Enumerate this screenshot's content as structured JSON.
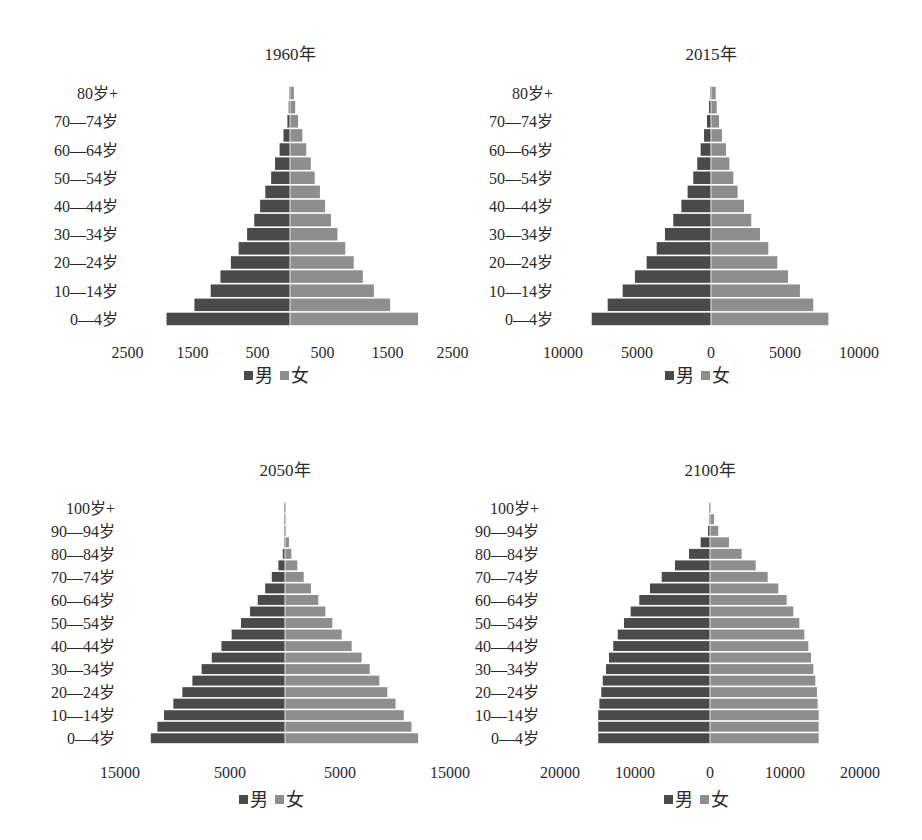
{
  "colors": {
    "male": "#4a4a4a",
    "female": "#8e8e8e",
    "gap": "#ffffff"
  },
  "legend": {
    "male": "男",
    "female": "女"
  },
  "chart_data": [
    {
      "type": "bar",
      "orientation": "horizontal",
      "subtype": "population-pyramid",
      "title": "1960年",
      "categories": [
        "0—4岁",
        "5—9岁",
        "10—14岁",
        "15—19岁",
        "20—24岁",
        "25—29岁",
        "30—34岁",
        "35—39岁",
        "40—44岁",
        "45—49岁",
        "50—54岁",
        "55—59岁",
        "60—64岁",
        "65—69岁",
        "70—74岁",
        "75—79岁",
        "80岁+"
      ],
      "visible_category_labels": [
        "0—4岁",
        "10—14岁",
        "20—24岁",
        "30—34岁",
        "40—44岁",
        "50—54岁",
        "60—64岁",
        "70—74岁",
        "80岁+"
      ],
      "series": [
        {
          "name": "男",
          "side": "left",
          "values": [
            1900,
            1470,
            1220,
            1070,
            910,
            790,
            660,
            550,
            460,
            380,
            290,
            230,
            160,
            100,
            40,
            20,
            5
          ]
        },
        {
          "name": "女",
          "side": "right",
          "values": [
            1970,
            1540,
            1290,
            1120,
            980,
            850,
            730,
            630,
            540,
            460,
            380,
            320,
            250,
            190,
            125,
            80,
            60
          ]
        }
      ],
      "xticks": [
        "2500",
        "1500",
        "500",
        "500",
        "1500",
        "2500"
      ],
      "xtick_values": [
        -2500,
        -1500,
        -500,
        500,
        1500,
        2500
      ],
      "xlim": [
        -2500,
        2500
      ],
      "legend_position": "bottom",
      "grid": false
    },
    {
      "type": "bar",
      "orientation": "horizontal",
      "subtype": "population-pyramid",
      "title": "2015年",
      "categories": [
        "0—4岁",
        "5—9岁",
        "10—14岁",
        "15—19岁",
        "20—24岁",
        "25—29岁",
        "30—34岁",
        "35—39岁",
        "40—44岁",
        "45—49岁",
        "50—54岁",
        "55—59岁",
        "60—64岁",
        "65—69岁",
        "70—74岁",
        "75—79岁",
        "80岁+"
      ],
      "visible_category_labels": [
        "0—4岁",
        "10—14岁",
        "20—24岁",
        "30—34岁",
        "40—44岁",
        "50—54岁",
        "60—64岁",
        "70—74岁",
        "80岁+"
      ],
      "series": [
        {
          "name": "男",
          "side": "left",
          "values": [
            8060,
            6980,
            5970,
            5140,
            4350,
            3670,
            3110,
            2550,
            2000,
            1580,
            1200,
            930,
            700,
            470,
            270,
            135,
            20
          ]
        },
        {
          "name": "女",
          "side": "right",
          "values": [
            7930,
            6910,
            6010,
            5200,
            4480,
            3870,
            3310,
            2720,
            2230,
            1800,
            1510,
            1240,
            1010,
            740,
            540,
            385,
            315
          ]
        }
      ],
      "xticks": [
        "10000",
        "5000",
        "0",
        "5000",
        "10000"
      ],
      "xtick_values": [
        -10000,
        -5000,
        0,
        5000,
        10000
      ],
      "xlim": [
        -10000,
        10000
      ],
      "legend_position": "bottom",
      "grid": false
    },
    {
      "type": "bar",
      "orientation": "horizontal",
      "subtype": "population-pyramid",
      "title": "2050年",
      "categories": [
        "0—4岁",
        "5—9岁",
        "10—14岁",
        "15—19岁",
        "20—24岁",
        "25—29岁",
        "30—34岁",
        "35—39岁",
        "40—44岁",
        "45—49岁",
        "50—54岁",
        "55—59岁",
        "60—64岁",
        "65—69岁",
        "70—74岁",
        "75—79岁",
        "80—84岁",
        "85—89岁",
        "90—94岁",
        "95—99岁",
        "100岁+"
      ],
      "visible_category_labels": [
        "0—4岁",
        "10—14岁",
        "20—24岁",
        "30—34岁",
        "40—44岁",
        "50—54岁",
        "60—64岁",
        "70—74岁",
        "80—84岁",
        "90—94岁",
        "100岁+"
      ],
      "series": [
        {
          "name": "男",
          "side": "left",
          "values": [
            12200,
            11600,
            11000,
            10150,
            9330,
            8420,
            7580,
            6660,
            5780,
            4850,
            4000,
            3180,
            2480,
            1800,
            1200,
            600,
            200,
            40,
            10,
            5,
            2
          ]
        },
        {
          "name": "女",
          "side": "right",
          "values": [
            12100,
            11500,
            10800,
            10050,
            9300,
            8570,
            7700,
            6970,
            6060,
            5150,
            4300,
            3670,
            3030,
            2360,
            1700,
            1120,
            580,
            360,
            100,
            50,
            20
          ]
        }
      ],
      "xticks": [
        "15000",
        "5000",
        "5000",
        "15000"
      ],
      "xtick_values": [
        -15000,
        -5000,
        5000,
        15000
      ],
      "xlim": [
        -15000,
        15000
      ],
      "legend_position": "bottom",
      "grid": false
    },
    {
      "type": "bar",
      "orientation": "horizontal",
      "subtype": "population-pyramid",
      "title": "2100年",
      "categories": [
        "0—4岁",
        "5—9岁",
        "10—14岁",
        "15—19岁",
        "20—24岁",
        "25—29岁",
        "30—34岁",
        "35—39岁",
        "40—44岁",
        "45—49岁",
        "50—54岁",
        "55—59岁",
        "60—64岁",
        "65—69岁",
        "70—74岁",
        "75—79岁",
        "80—84岁",
        "85—89岁",
        "90—94岁",
        "95—99岁",
        "100岁+"
      ],
      "visible_category_labels": [
        "0—4岁",
        "10—14岁",
        "20—24岁",
        "30—34岁",
        "40—44岁",
        "50—54岁",
        "60—64岁",
        "70—74岁",
        "80—84岁",
        "90—94岁",
        "100岁+"
      ],
      "series": [
        {
          "name": "男",
          "side": "left",
          "values": [
            14900,
            14900,
            14900,
            14750,
            14500,
            14300,
            13870,
            13470,
            12900,
            12300,
            11470,
            10580,
            9430,
            8000,
            6440,
            4670,
            2800,
            1240,
            270,
            60,
            20
          ]
        },
        {
          "name": "女",
          "side": "right",
          "values": [
            14490,
            14490,
            14490,
            14350,
            14260,
            14040,
            13780,
            13470,
            13110,
            12580,
            11910,
            11110,
            10220,
            9110,
            7690,
            6090,
            4220,
            2530,
            1110,
            530,
            100
          ]
        }
      ],
      "xticks": [
        "20000",
        "10000",
        "0",
        "10000",
        "20000"
      ],
      "xtick_values": [
        -20000,
        -10000,
        0,
        10000,
        20000
      ],
      "xlim": [
        -20000,
        20000
      ],
      "legend_position": "bottom",
      "grid": false
    }
  ]
}
